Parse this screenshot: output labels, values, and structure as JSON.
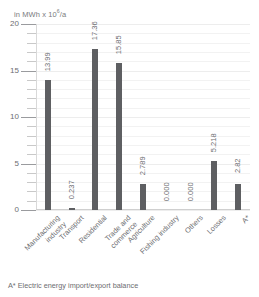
{
  "chart_data": {
    "type": "bar",
    "title": "",
    "unit_caption": "in MWh x 10",
    "unit_exponent": "6",
    "unit_suffix": "/a",
    "xlabel": "",
    "ylabel": "in MWh x 10^6/a",
    "ylim": [
      0,
      20
    ],
    "grid": true,
    "legend": "none",
    "major_ticks": [
      "20",
      "15",
      "10",
      "5",
      "0"
    ],
    "major_tick_values": [
      20,
      15,
      10,
      5,
      0
    ],
    "minor_tick_step": 1,
    "categories": [
      "Manufacturing\nindustry",
      "Transport",
      "Residential",
      "Trade and\ncommerce",
      "Agriculture",
      "Fishing industry",
      "Others",
      "Losses",
      "A*"
    ],
    "values": [
      13.99,
      0.237,
      17.36,
      15.85,
      2.789,
      0.0,
      0.0,
      5.218,
      2.82
    ],
    "value_labels": [
      "13.99",
      "0.237",
      "17.36",
      "15.85",
      "2.789",
      "0.000",
      "0.000",
      "5.218",
      "2.82"
    ],
    "bar_color": "#5e5f62",
    "grid_color": "#f2f2f2",
    "text_color": "#6d6e71"
  },
  "footnote": "A* Electric energy import/export balance"
}
